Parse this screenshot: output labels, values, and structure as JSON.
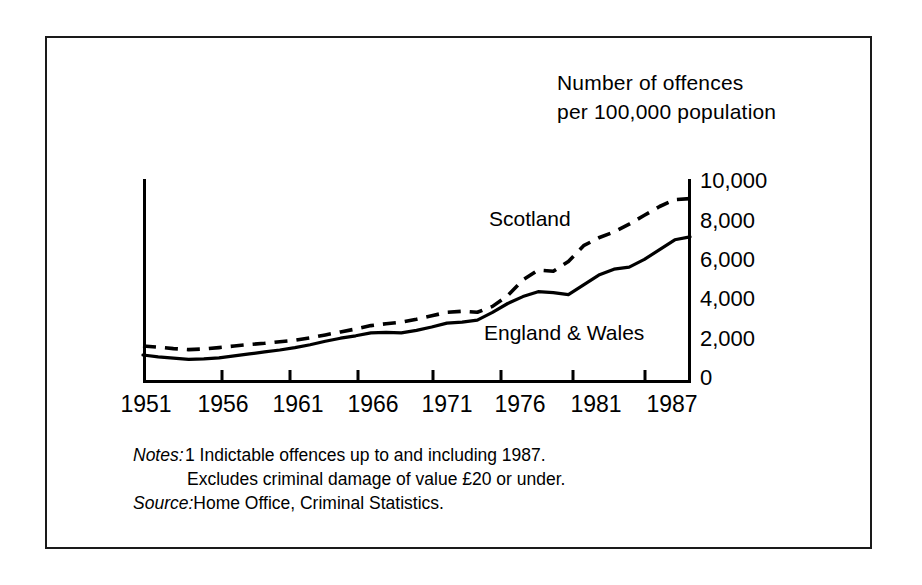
{
  "figure": {
    "axis_title": "Number of offences\nper 100,000 population",
    "notes_label": "Notes:",
    "note_1": "1 Indictable offences up to and including 1987.",
    "note_2": "Excludes criminal damage of value £20 or under.",
    "source_label": "Source:",
    "source_text": "Home Office, Criminal Statistics.",
    "colors": {
      "ink": "#000000",
      "frame": "#1a1a1a",
      "background": "#ffffff"
    }
  },
  "chart_data": {
    "type": "line",
    "title": "Number of offences per 100,000 population",
    "xlabel": "",
    "ylabel": "Number of offences per 100,000 population",
    "xlim": [
      1951,
      1987
    ],
    "ylim": [
      0,
      10000
    ],
    "yticks": [
      0,
      2000,
      4000,
      6000,
      8000,
      10000
    ],
    "ytick_labels": [
      "0",
      "2,000",
      "4,000",
      "6,000",
      "8,000",
      "10,000"
    ],
    "xticks": [
      1951,
      1956,
      1961,
      1966,
      1971,
      1976,
      1981,
      1987
    ],
    "xtick_labels": [
      "1951",
      "1956",
      "1961",
      "1966",
      "1971",
      "1976",
      "1981",
      "1987"
    ],
    "grid": false,
    "legend_position": "in-plot annotations",
    "x": [
      1951,
      1952,
      1953,
      1954,
      1955,
      1956,
      1957,
      1958,
      1959,
      1960,
      1961,
      1962,
      1963,
      1964,
      1965,
      1966,
      1967,
      1968,
      1969,
      1970,
      1971,
      1972,
      1973,
      1974,
      1975,
      1976,
      1977,
      1978,
      1979,
      1980,
      1981,
      1982,
      1983,
      1984,
      1985,
      1986,
      1987
    ],
    "series": [
      {
        "name": "Scotland",
        "style": "dashed",
        "values": [
          1580,
          1520,
          1450,
          1400,
          1430,
          1500,
          1580,
          1660,
          1720,
          1800,
          1880,
          2000,
          2150,
          2300,
          2450,
          2620,
          2720,
          2800,
          2950,
          3120,
          3300,
          3350,
          3300,
          3600,
          4150,
          4950,
          5450,
          5400,
          5900,
          6700,
          7100,
          7400,
          7800,
          8250,
          8700,
          9050,
          9100
        ]
      },
      {
        "name": "England & Wales",
        "style": "solid",
        "values": [
          1120,
          1030,
          960,
          900,
          930,
          980,
          1080,
          1180,
          1280,
          1380,
          1500,
          1650,
          1820,
          1980,
          2100,
          2250,
          2280,
          2250,
          2380,
          2550,
          2750,
          2800,
          2900,
          3300,
          3750,
          4100,
          4350,
          4300,
          4200,
          4700,
          5200,
          5500,
          5600,
          6000,
          6500,
          7000,
          7150
        ]
      }
    ],
    "annotations": [
      {
        "text": "Scotland",
        "series": "Scotland"
      },
      {
        "text": "England & Wales",
        "series": "England & Wales"
      }
    ]
  },
  "axes_geometry": {
    "x_left_px": 143,
    "x_right_px": 690,
    "y_zero_px": 377,
    "y_top_px": 181,
    "y_axis_top_px": 179
  }
}
